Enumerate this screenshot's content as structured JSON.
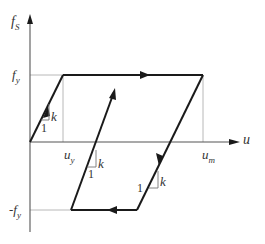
{
  "diagram": {
    "type": "elastoplastic hysteresis loop",
    "axes": {
      "y_label": "fS",
      "y_label_main": "f",
      "y_label_sub": "S",
      "x_label": "u"
    },
    "levels": {
      "fy_main": "f",
      "fy_sub": "y",
      "neg_fy_prefix": "-",
      "neg_fy_main": "f",
      "neg_fy_sub": "y",
      "uy_main": "u",
      "uy_sub": "y",
      "um_main": "u",
      "um_sub": "m"
    },
    "slope_triangles": [
      {
        "rise": "k",
        "run": "1",
        "segment": "initial-loading"
      },
      {
        "rise": "k",
        "run": "1",
        "segment": "reloading"
      },
      {
        "rise": "k",
        "run": "1",
        "segment": "unloading"
      }
    ],
    "colors": {
      "path": "#1a1a1a",
      "guides": "#b0b0b0",
      "axes": "#555555"
    }
  }
}
